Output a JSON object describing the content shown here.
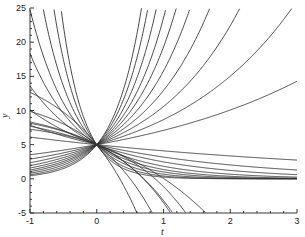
{
  "chart_data": {
    "type": "line",
    "title": "",
    "xlabel": "t",
    "ylabel": "y",
    "xlim": [
      -1,
      3
    ],
    "ylim": [
      -5,
      25
    ],
    "x_ticks": [
      "-1",
      "0",
      "1",
      "2",
      "3"
    ],
    "y_ticks": [
      "-5",
      "0",
      "5",
      "10",
      "15",
      "20",
      "25"
    ],
    "grid": false,
    "legend": "none",
    "annotations": "Family of solution curves all passing through the point (0, 5)",
    "common_point": [
      0,
      5
    ],
    "series": [
      {
        "name": "r=-3.0",
        "rate": -3.0
      },
      {
        "name": "r=-2.5",
        "rate": -2.5
      },
      {
        "name": "r=-2.0",
        "rate": -2.0
      },
      {
        "name": "r=-1.6",
        "rate": -1.6
      },
      {
        "name": "r=-1.3",
        "rate": -1.3
      },
      {
        "name": "r=-1.0",
        "rate": -1.0
      },
      {
        "name": "r=-0.7",
        "rate": -0.7
      },
      {
        "name": "r=-0.45",
        "rate": -0.45
      },
      {
        "name": "r=-0.2",
        "rate": -0.2
      },
      {
        "name": "r=0.35",
        "rate": 0.35
      },
      {
        "name": "r=0.55",
        "rate": 0.55
      },
      {
        "name": "r=0.75",
        "rate": 0.75
      },
      {
        "name": "r=0.95",
        "rate": 0.95
      },
      {
        "name": "r=1.15",
        "rate": 1.15
      },
      {
        "name": "r=1.35",
        "rate": 1.35
      },
      {
        "name": "r=1.55",
        "rate": 1.55
      },
      {
        "name": "r=1.8",
        "rate": 1.8
      },
      {
        "name": "r=2.1",
        "rate": 2.1
      },
      {
        "name": "r=2.4",
        "rate": 2.4
      }
    ],
    "descending_series": [
      {
        "name": "d1",
        "k": 22,
        "lambda": 1.0
      },
      {
        "name": "d2",
        "k": 14,
        "lambda": 1.0
      },
      {
        "name": "d3",
        "k": 9,
        "lambda": 1.0
      },
      {
        "name": "d4",
        "k": 6.5,
        "lambda": 1.0
      },
      {
        "name": "d5",
        "k": 6,
        "lambda": 0.6
      },
      {
        "name": "d6",
        "k": 5.6,
        "lambda": 0.9
      }
    ]
  }
}
